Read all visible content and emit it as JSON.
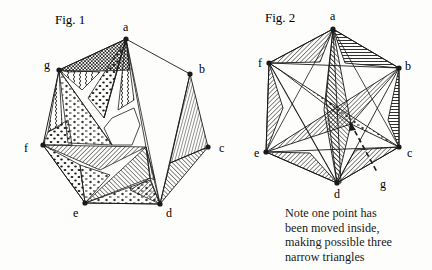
{
  "figures": [
    {
      "title": "Fig. 1",
      "vertices": [
        {
          "name": "a",
          "x": 126,
          "y": 39
        },
        {
          "name": "b",
          "x": 190,
          "y": 74
        },
        {
          "name": "c",
          "x": 208,
          "y": 147
        },
        {
          "name": "d",
          "x": 160,
          "y": 204
        },
        {
          "name": "e",
          "x": 85,
          "y": 203
        },
        {
          "name": "f",
          "x": 43,
          "y": 145
        },
        {
          "name": "g",
          "x": 59,
          "y": 70
        }
      ]
    },
    {
      "title": "Fig. 2",
      "vertices": [
        {
          "name": "a",
          "x": 333,
          "y": 29
        },
        {
          "name": "b",
          "x": 399,
          "y": 68
        },
        {
          "name": "c",
          "x": 399,
          "y": 147
        },
        {
          "name": "d",
          "x": 337,
          "y": 183
        },
        {
          "name": "e",
          "x": 266,
          "y": 152
        },
        {
          "name": "f",
          "x": 269,
          "y": 63
        },
        {
          "name": "g",
          "x": 351,
          "y": 124,
          "inner": true
        }
      ],
      "note_lines": [
        "Note one point has",
        "been moved inside,",
        "making possible three",
        "narrow triangles"
      ]
    }
  ],
  "labels": {
    "fig1": {
      "a": "a",
      "b": "b",
      "c": "c",
      "d": "d",
      "e": "e",
      "f": "f",
      "g": "g"
    },
    "fig2": {
      "a": "a",
      "b": "b",
      "c": "c",
      "d": "d",
      "e": "e",
      "f": "f",
      "g": "g"
    }
  },
  "colors": {
    "ink": "#1a1a1a",
    "paper": "#fdfdfb"
  }
}
